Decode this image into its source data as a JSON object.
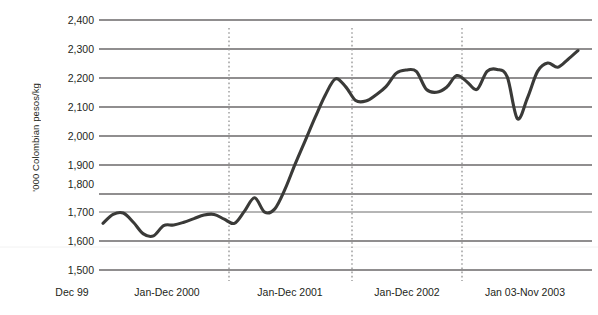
{
  "chart_data": {
    "type": "line",
    "title": "",
    "subtitle": "",
    "xlabel": "",
    "ylabel": "'000 Colombian pesos/kg",
    "ylim": [
      1500,
      2400
    ],
    "ytick_labels": [
      "2,400",
      "2,300",
      "2,200",
      "2,100",
      "2,000",
      "1,900",
      "1,800",
      "1,700",
      "1,600",
      "1,500"
    ],
    "ytick_values": [
      2400,
      2300,
      2200,
      2100,
      2000,
      1900,
      1800,
      1700,
      1600,
      1500
    ],
    "xtick_labels": [
      "Dec 99",
      "Jan-Dec 2000",
      "Jan-Dec 2001",
      "Jan-Dec 2002",
      "Jan 03-Nov 2003"
    ],
    "period_dividers": [
      "Jan-Dec 2000 / Jan-Dec 2001",
      "Jan-Dec 2001 / Jan-Dec 2002",
      "Jan-Dec 2002 / Jan 03-Nov 2003"
    ],
    "grid": true,
    "grid_orientation": "horizontal",
    "legend": "none",
    "line_color": "#3a3a38",
    "grid_color": "#231f20",
    "divider_color": "#a6a6a6",
    "series": [
      {
        "name": "Price",
        "x": [
          "Dec 99",
          "Jan 00",
          "Feb 00",
          "Mar 00",
          "Apr 00",
          "May 00",
          "Jun 00",
          "Jul 00",
          "Aug 00",
          "Sep 00",
          "Oct 00",
          "Nov 00",
          "Dec 00",
          "Jan 01",
          "Feb 01",
          "Mar 01",
          "Apr 01",
          "May 01",
          "Jun 01",
          "Jul 01",
          "Aug 01",
          "Sep 01",
          "Oct 01",
          "Nov 01",
          "Dec 01",
          "Jan 02",
          "Feb 02",
          "Mar 02",
          "Apr 02",
          "May 02",
          "Jun 02",
          "Jul 02",
          "Aug 02",
          "Sep 02",
          "Oct 02",
          "Nov 02",
          "Dec 02",
          "Jan 03",
          "Feb 03",
          "Mar 03",
          "Apr 03",
          "May 03",
          "Jun 03",
          "Jul 03",
          "Aug 03",
          "Sep 03",
          "Oct 03",
          "Nov 03"
        ],
        "values": [
          1668,
          1700,
          1705,
          1672,
          1630,
          1623,
          1660,
          1662,
          1672,
          1685,
          1698,
          1700,
          1683,
          1668,
          1712,
          1760,
          1708,
          1720,
          1790,
          1880,
          1965,
          2050,
          2130,
          2188,
          2160,
          2110,
          2108,
          2130,
          2160,
          2208,
          2220,
          2215,
          2150,
          2140,
          2158,
          2200,
          2178,
          2150,
          2215,
          2222,
          2195,
          2045,
          2120,
          2215,
          2245,
          2230,
          2258,
          2290
        ]
      }
    ]
  },
  "axis": {
    "ylabel": "'000 Colombian pesos/kg",
    "yticks": [
      "2,400",
      "2,300",
      "2,200",
      "2,100",
      "2,000",
      "1,900",
      "1,800",
      "1,700",
      "1,600",
      "1,500"
    ],
    "xticks": [
      "Dec 99",
      "Jan-Dec 2000",
      "Jan-Dec 2001",
      "Jan-Dec 2002",
      "Jan 03-Nov 2003"
    ]
  }
}
